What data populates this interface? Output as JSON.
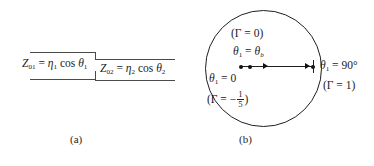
{
  "figure": {
    "panels": [
      {
        "id": "a",
        "caption": "(a)",
        "type": "stepped-transmission-line",
        "labels": {
          "left_impedance": "Z",
          "left_impedance_sub": "01",
          "left_equals": "=",
          "left_eta": "η",
          "left_eta_sub": "1",
          "left_cos": "cos",
          "left_theta": "θ",
          "left_theta_sub": "1",
          "right_impedance": "Z",
          "right_impedance_sub": "02",
          "right_equals": "=",
          "right_eta": "η",
          "right_eta_sub": "2",
          "right_cos": "cos",
          "right_theta": "θ",
          "right_theta_sub": "2"
        }
      },
      {
        "id": "b",
        "caption": "(b)",
        "type": "reflection-coefficient-circle",
        "labels": {
          "top_gamma": "(Γ = 0)",
          "theta_brewster_theta": "θ",
          "theta_brewster_sub": "1",
          "theta_brewster_equals": "=",
          "theta_brewster_value": "θ",
          "theta_brewster_value_sub": "b",
          "theta_zero": "θ",
          "theta_zero_sub": "1",
          "theta_zero_equals": "= 0",
          "gamma_neg_open": "(Γ = −",
          "gamma_neg_num": "1",
          "gamma_neg_den": "5",
          "gamma_neg_close": ")",
          "theta_ninety": "θ",
          "theta_ninety_sub": "1",
          "theta_ninety_equals": "= 90°",
          "gamma_one": "(Γ = 1)"
        },
        "markers": {
          "dot_theta_zero": "θ₁ = 0 point",
          "dot_theta_brewster": "θ₁ = θ_b point",
          "dot_theta_ninety": "θ₁ = 90° point"
        }
      }
    ]
  }
}
